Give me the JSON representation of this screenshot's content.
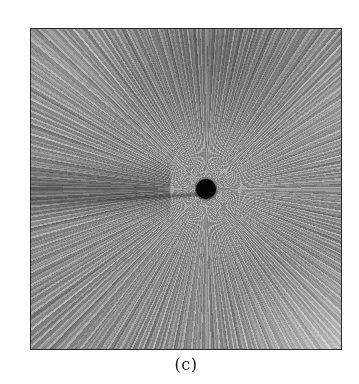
{
  "figure": {
    "panel_label": "(c)",
    "image_description": "grayscale radial streak pattern with central black dot",
    "colors": {
      "frame": "#2a2a2a",
      "base_gray": "#8a8a8a",
      "dark_band": "#5a5a5a",
      "light_corner": "#b8b8b8",
      "center_dot": "#050505"
    }
  }
}
